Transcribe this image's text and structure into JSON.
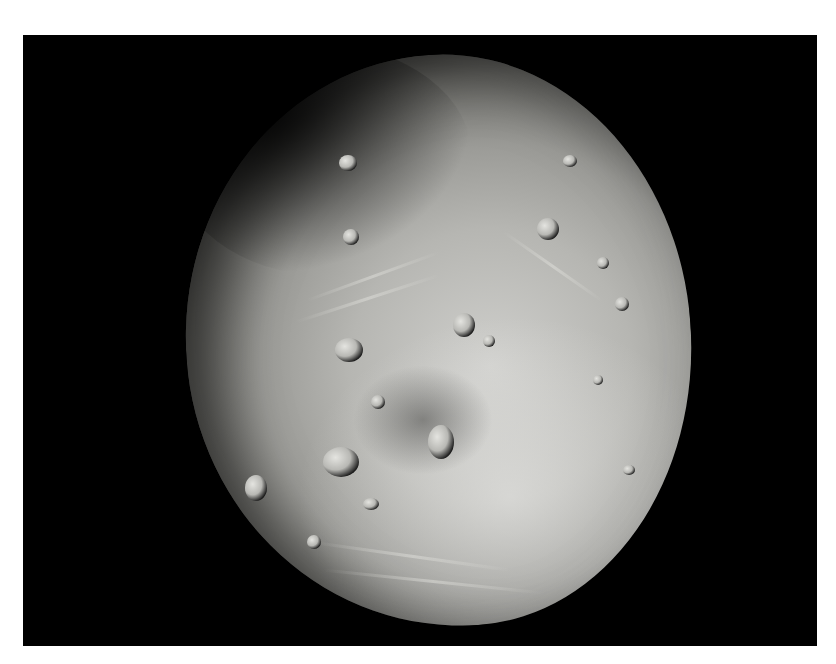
{
  "image": {
    "subject": "asteroid",
    "description": "Grayscale photograph of a heavily cratered asteroid against a black background",
    "colors": {
      "border": "#ffffff",
      "background": "#000000",
      "surface_light": "#cfcfcc",
      "surface_mid": "#9a9a96",
      "surface_shadow": "#3a3a38"
    }
  }
}
